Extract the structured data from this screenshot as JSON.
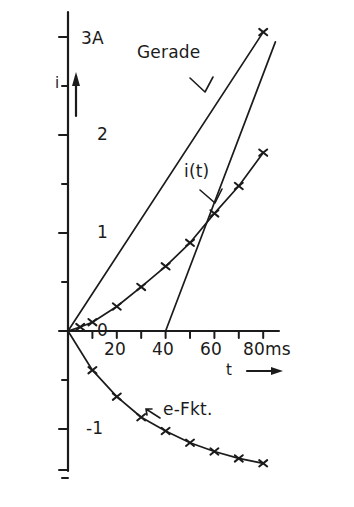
{
  "figure": {
    "background_color": "#ffffff",
    "ink_color": "#1b1b1b"
  },
  "axes": {
    "y_axis_name": "i",
    "y_axis_unit_label": "3A",
    "x_axis_name": "t",
    "x_axis_unit_label": "80ms",
    "y_tick_labels": [
      "3A",
      "2",
      "1",
      "0",
      "-1"
    ],
    "x_tick_labels": [
      "20",
      "40",
      "60",
      "80ms"
    ],
    "y_arrow": "up-arrow-icon",
    "x_arrow": "right-arrow-icon"
  },
  "annotations": {
    "gerade": "Gerade",
    "i_of_t": "i(t)",
    "e_fkt": "e-Fkt."
  },
  "chart_data": {
    "type": "line",
    "title": "",
    "xlabel": "t",
    "ylabel": "i",
    "xunit": "ms",
    "yunit": "A",
    "xlim": [
      0,
      85
    ],
    "ylim": [
      -1.5,
      3.1
    ],
    "xticks": [
      0,
      10,
      20,
      30,
      40,
      50,
      60,
      70,
      80
    ],
    "xtick_labels": [
      "",
      "",
      "20",
      "",
      "40",
      "",
      "60",
      "",
      "80ms"
    ],
    "yticks": [
      -1.5,
      -1.0,
      -0.5,
      0,
      0.5,
      1.0,
      1.5,
      2.0,
      2.5,
      3.0
    ],
    "ytick_labels": [
      "",
      "-1",
      "",
      "0",
      "",
      "1",
      "",
      "2",
      "",
      "3A"
    ],
    "grid": false,
    "legend": "inline-annotations",
    "series": [
      {
        "name": "Gerade",
        "type": "line",
        "markers": "end-only",
        "x": [
          0,
          80
        ],
        "y": [
          0,
          3.05
        ]
      },
      {
        "name": "Gerade-verschoben",
        "type": "line",
        "markers": "none",
        "x": [
          40,
          85
        ],
        "y": [
          0,
          2.95
        ]
      },
      {
        "name": "i(t)",
        "type": "line",
        "markers": "cross",
        "x": [
          0,
          5,
          10,
          20,
          30,
          40,
          50,
          60,
          70,
          80
        ],
        "y": [
          0,
          0.04,
          0.09,
          0.25,
          0.45,
          0.66,
          0.9,
          1.2,
          1.48,
          1.82
        ]
      },
      {
        "name": "e-Fkt.",
        "type": "line",
        "markers": "cross",
        "x": [
          0,
          10,
          20,
          30,
          40,
          50,
          60,
          70,
          80
        ],
        "y": [
          0,
          -0.4,
          -0.67,
          -0.88,
          -1.02,
          -1.14,
          -1.23,
          -1.3,
          -1.35
        ]
      }
    ]
  }
}
